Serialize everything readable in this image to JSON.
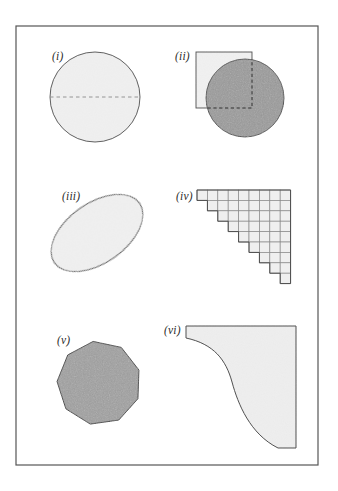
{
  "figure": {
    "background_color": "#ffffff",
    "frame": {
      "stroke_color": "#555555",
      "x": 16,
      "y": 26,
      "width": 302,
      "height": 439,
      "stroke_width": 1.2
    },
    "panels": [
      {
        "id": "i",
        "label": "(i)",
        "label_x": 52,
        "label_y": 60,
        "shape": "circle-with-dashed-diameter",
        "description": "Light gray disc with a dashed horizontal diameter",
        "fill_color": "#f0f0f0",
        "stroke_color": "#4a4a4a",
        "dash_color": "#8a8a8a",
        "center_x": 95,
        "center_y": 97,
        "radius": 45
      },
      {
        "id": "ii",
        "label": "(ii)",
        "label_x": 175,
        "label_y": 60,
        "shape": "square-union-circle",
        "description": "Light square overlapping a darker gray circle, dashed hidden edges",
        "square_fill_color": "#f1f1f1",
        "circle_fill_color": "#9a9a9a",
        "stroke_color": "#4a4a4a",
        "dash_color": "#3a3a3a",
        "square_x": 196,
        "square_y": 52,
        "square_size": 56,
        "circle_center_x": 245,
        "circle_center_y": 98,
        "circle_radius": 39
      },
      {
        "id": "iii",
        "label": "(iii)",
        "label_x": 62,
        "label_y": 200,
        "shape": "rotated-ellipse",
        "description": "Light gray ellipse tilted counter-clockwise",
        "fill_color": "#f0f0f0",
        "stroke_color": "#4a4a4a",
        "center_x": 97,
        "center_y": 233,
        "radius_x": 52,
        "radius_y": 30,
        "rotation_degrees": -35
      },
      {
        "id": "iv",
        "label": "(iv)",
        "label_x": 176,
        "label_y": 200,
        "shape": "staircase-grid",
        "description": "Staircase (triangular) arrangement of unit squares, 9 rows",
        "fill_color": "#efefef",
        "stroke_color": "#8a8a8a",
        "outline_color": "#4a4a4a",
        "origin_x": 197,
        "origin_y": 190,
        "cell_size": 10.4,
        "rows": 9,
        "columns": 9,
        "row_lengths": [
          9,
          8,
          7,
          6,
          5,
          4,
          3,
          2,
          1
        ]
      },
      {
        "id": "v",
        "label": "(v)",
        "label_x": 57,
        "label_y": 344,
        "shape": "regular-polygon",
        "description": "Medium gray regular polygon (nonagon-like)",
        "fill_color": "#a0a0a0",
        "stroke_color": "#3a3a3a",
        "center_x": 99,
        "center_y": 383,
        "radius": 42,
        "sides": 9,
        "rotation_degrees": -8
      },
      {
        "id": "vi",
        "label": "(vi)",
        "label_x": 164,
        "label_y": 334,
        "shape": "concave-curved-region",
        "description": "Region bounded by straight top and right edges with an S-curved concave left-bottom boundary",
        "fill_color": "#eeeeee",
        "stroke_color": "#4a4a4a",
        "top_left_x": 181,
        "top_y": 326,
        "right_x": 296,
        "bottom_y": 448
      }
    ]
  }
}
